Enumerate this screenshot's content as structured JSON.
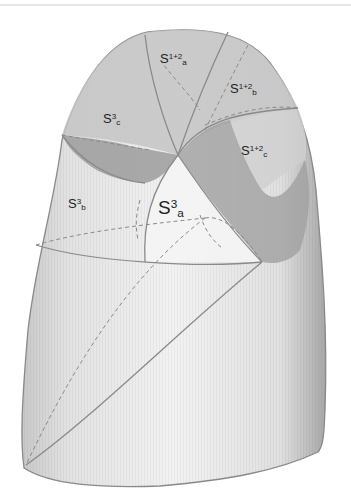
{
  "figure": {
    "colors": {
      "lobe_fill": "#e4e4e4",
      "shaded_segment": "#b8b8b8",
      "dark_band": "#9a9a9a",
      "outline": "#8a8a8a",
      "label_text": "#222222"
    },
    "labels": [
      {
        "id": "s12a",
        "base": "S",
        "sup": "1+2",
        "sub": "a"
      },
      {
        "id": "s12b",
        "base": "S",
        "sup": "1+2",
        "sub": "b"
      },
      {
        "id": "s12c",
        "base": "S",
        "sup": "1+2",
        "sub": "c"
      },
      {
        "id": "s3c",
        "base": "S",
        "sup": "3",
        "sub": "c"
      },
      {
        "id": "s3b",
        "base": "S",
        "sup": "3",
        "sub": "b"
      },
      {
        "id": "s3a",
        "base": "S",
        "sup": "3",
        "sub": "a"
      }
    ]
  }
}
